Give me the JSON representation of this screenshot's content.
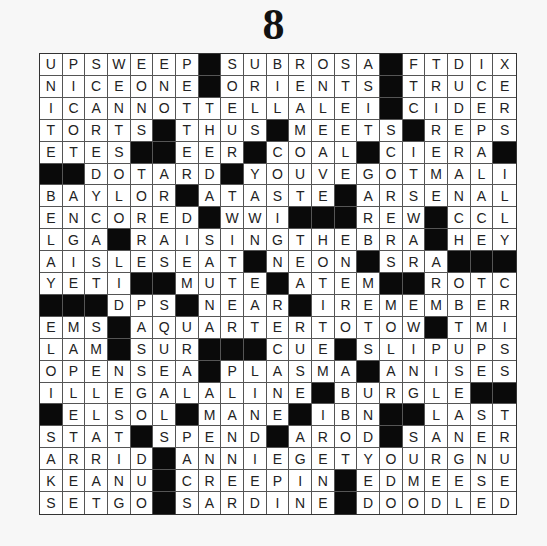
{
  "page_number": "8",
  "puzzle": {
    "rows": 21,
    "cols": 21,
    "block_char": "#",
    "colors": {
      "block": "#0a0a0a",
      "cell": "#ffffff",
      "letter": "#222222"
    },
    "grid": [
      "UPSWEEP#SUBROSA#FTDIX",
      "NICEONE#ORIENTS#TRUCE",
      "ICANNOTTELLALEI#CIDER",
      "TORTS#THUS#MEETS#REPS",
      "ETES##EER#COAL#CIERA#",
      "##DOTARD#YOUVEGOTMALI",
      "BAYLOR#ATASTE#ARSENAL",
      "ENCORED#WWI###REW#CCL",
      "LGA#RAISINGTHEBRA#HEY",
      "AISLESEAT#NEON#SRA###",
      "YETI##MUTE#ATEM##ROTC",
      "###DPS#NEAR#IREMEMBER",
      "EMS#AQUARTERTOTOW#TMI",
      "LAM#SUR###CUE#SLIPUPS",
      "OPENSEA#PLASMA#ANISES",
      "ILLEGALALINE#BURGLE##",
      "#ELSOL#MANE#IBN##LAST",
      "STAT#SPEND#AROD#SANER",
      "ARRID#ANNIEGETYOURGNU",
      "KEANU#CREEPIN#EDMEESE",
      "SETGO#SARDINE#DOODLED"
    ]
  }
}
